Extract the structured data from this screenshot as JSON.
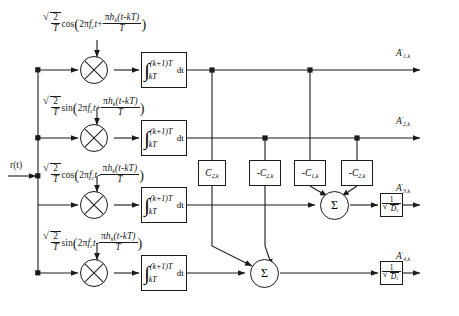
{
  "diagram": {
    "input": {
      "label": "r(t)"
    },
    "branches": [
      {
        "id": 1,
        "carrier": "sqrt(2/T) cos(2*pi*fc*t + pi*h_k*(t-kT)/T)",
        "carrier_parts": {
          "amp_num": "2",
          "amp_den": "T",
          "func": "cos",
          "arg_lead": "2",
          "pi": "π",
          "fc": "f",
          "fc_sub": "c",
          "t": "t",
          "sign": "+",
          "phase_num_pi": "π",
          "phase_num_h": "h",
          "phase_num_h_sub": "k",
          "phase_num_t": "(t-kT)",
          "phase_den": "T"
        },
        "integrator": {
          "upper": "(k+1)T",
          "lower": "kT",
          "diff": "dt"
        },
        "output": {
          "base": "A",
          "prime": "′",
          "sub": "1,k"
        }
      },
      {
        "id": 2,
        "carrier": "sqrt(2/T) sin(2*pi*fc*t + pi*h_k*(t-kT)/T)",
        "carrier_parts": {
          "amp_num": "2",
          "amp_den": "T",
          "func": "sin",
          "arg_lead": "2",
          "pi": "π",
          "fc": "f",
          "fc_sub": "c",
          "t": "t",
          "sign": "+",
          "phase_num_pi": "π",
          "phase_num_h": "h",
          "phase_num_h_sub": "k",
          "phase_num_t": "(t-kT)",
          "phase_den": "T"
        },
        "integrator": {
          "upper": "(k+1)T",
          "lower": "kT",
          "diff": "dt"
        },
        "output": {
          "base": "A",
          "prime": "′",
          "sub": "2,k"
        }
      },
      {
        "id": 3,
        "carrier": "sqrt(2/T) cos(2*pi*fc*t - pi*h_k*(t-kT)/T)",
        "carrier_parts": {
          "amp_num": "2",
          "amp_den": "T",
          "func": "cos",
          "arg_lead": "2",
          "pi": "π",
          "fc": "f",
          "fc_sub": "c",
          "t": "t",
          "sign": "-",
          "phase_num_pi": "π",
          "phase_num_h": "h",
          "phase_num_h_sub": "k",
          "phase_num_t": "(t-kT)",
          "phase_den": "T"
        },
        "integrator": {
          "upper": "(k+1)T",
          "lower": "kT",
          "diff": "dt"
        },
        "output": {
          "base": "A",
          "prime": "′",
          "sub": "3,k"
        }
      },
      {
        "id": 4,
        "carrier": "sqrt(2/T) sin(2*pi*fc*t - pi*h_k*(t-kT)/T)",
        "carrier_parts": {
          "amp_num": "2",
          "amp_den": "T",
          "func": "sin",
          "arg_lead": "2",
          "pi": "π",
          "fc": "f",
          "fc_sub": "c",
          "t": "t",
          "sign": "-",
          "phase_num_pi": "π",
          "phase_num_h": "h",
          "phase_num_h_sub": "k",
          "phase_num_t": "(t-kT)",
          "phase_den": "T"
        },
        "integrator": {
          "upper": "(k+1)T",
          "lower": "kT",
          "diff": "dt"
        },
        "output": {
          "base": "A",
          "prime": "′",
          "sub": "4,k"
        }
      }
    ],
    "coefficients": [
      {
        "id": "c1",
        "sign": "",
        "base": "C",
        "sub": "2,k",
        "text": "C2,k"
      },
      {
        "id": "c2",
        "sign": "-",
        "base": "C",
        "sub": "2,k",
        "text": "-C2,k"
      },
      {
        "id": "c3",
        "sign": "-",
        "base": "C",
        "sub": "1,k",
        "text": "-C1,k"
      },
      {
        "id": "c4",
        "sign": "-",
        "base": "C",
        "sub": "2,k",
        "text": "-C2,k"
      }
    ],
    "summers": [
      {
        "id": "sum-upper",
        "glyph": "Σ"
      },
      {
        "id": "sum-lower",
        "glyph": "Σ"
      }
    ],
    "gains": [
      {
        "id": "gain-upper",
        "num": "1",
        "den_root": "D",
        "den_sub": "1"
      },
      {
        "id": "gain-lower",
        "num": "1",
        "den_root": "D",
        "den_sub": "1"
      }
    ],
    "symbols": {
      "multiply": "×",
      "integral": "∫",
      "sigma": "Σ",
      "radical": "√"
    },
    "colors": {
      "line": "#1b1b1b",
      "background": "#ffffff"
    }
  }
}
